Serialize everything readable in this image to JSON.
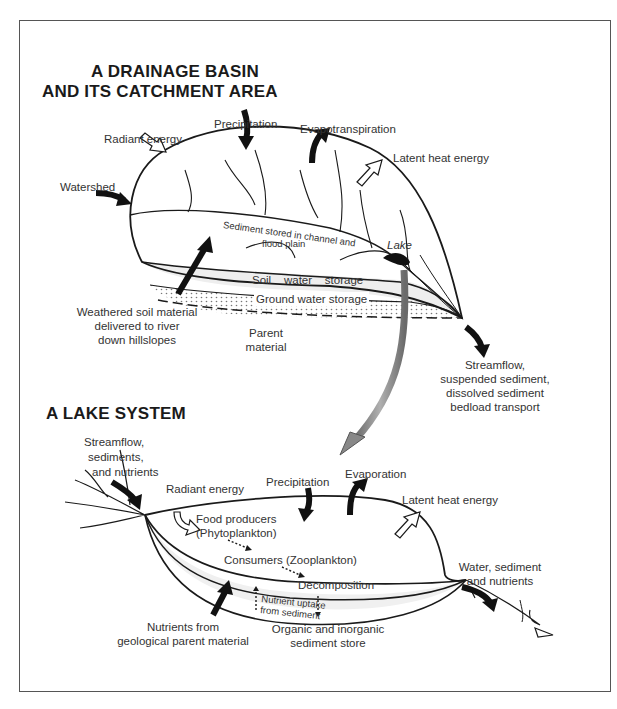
{
  "diagram": {
    "drainage_basin": {
      "title_line1": "A DRAINAGE BASIN",
      "title_line2": "AND ITS CATCHMENT AREA",
      "labels": {
        "precipitation": "Precipitation",
        "evapotranspiration": "Evapotranspiration",
        "radiant_energy": "Radiant energy",
        "latent_heat": "Latent heat energy",
        "watershed": "Watershed",
        "sediment_line1": "Sediment stored in channel and",
        "sediment_line2": "flood plain",
        "lake": "Lake",
        "soil_water": "Soil    water    storage",
        "ground_water": "Ground water storage",
        "weathered_line1": "Weathered soil material",
        "weathered_line2": "delivered to river",
        "weathered_line3": "down hillslopes",
        "parent_line1": "Parent",
        "parent_line2": "material",
        "streamflow_line1": "Streamflow,",
        "streamflow_line2": "suspended sediment,",
        "streamflow_line3": "dissolved sediment",
        "streamflow_line4": "bedload transport"
      }
    },
    "lake_system": {
      "title": "A LAKE SYSTEM",
      "labels": {
        "inflow_line1": "Streamflow,",
        "inflow_line2": "sediments,",
        "inflow_line3": "and nutrients",
        "radiant_energy": "Radiant energy",
        "precipitation": "Precipitation",
        "evaporation": "Evaporation",
        "latent_heat": "Latent heat energy",
        "producers_line1": "Food producers",
        "producers_line2": "(Phytoplankton)",
        "consumers": "Consumers (Zooplankton)",
        "decomposition": "Decomposition",
        "uptake_line1": "Nutrient uptake",
        "uptake_line2": "from sediment",
        "store_line1": "Organic and inorganic",
        "store_line2": "sediment store",
        "nutrients_line1": "Nutrients from",
        "nutrients_line2": "geological parent material",
        "outflow_line1": "Water, sediment",
        "outflow_line2": "and nutrients"
      }
    },
    "colors": {
      "ink": "#1a1a1a",
      "text": "#333333",
      "connector_arrow": "#8a8a8a",
      "stipple": "#bbbbbb",
      "frame": "#555555"
    }
  }
}
